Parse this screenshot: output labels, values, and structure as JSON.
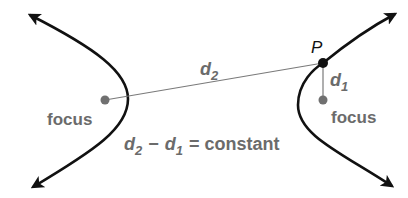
{
  "diagram": {
    "type": "hyperbola-focus-definition",
    "labels": {
      "point": "P",
      "d2_var": "d",
      "d2_sub": "2",
      "d1_var": "d",
      "d1_sub": "1",
      "left_focus": "focus",
      "right_focus": "focus"
    },
    "equation": {
      "term1_var": "d",
      "term1_sub": "2",
      "minus": "−",
      "term2_var": "d",
      "term2_sub": "1",
      "equals_text": "= constant"
    },
    "colors": {
      "curve": "#111111",
      "label": "#6b6b6b",
      "segment": "#7a7a7a",
      "focus_dot": "#707070",
      "point_dot": "#111111"
    }
  }
}
